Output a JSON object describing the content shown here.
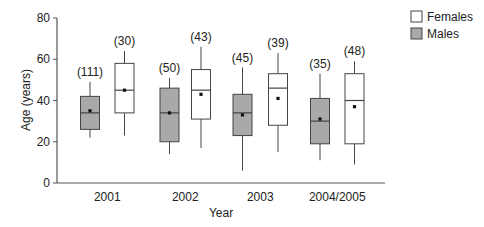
{
  "chart_data": {
    "type": "boxplot",
    "title": "",
    "xlabel": "Year",
    "ylabel": "Age (years)",
    "ylim": [
      0,
      80
    ],
    "yticks": [
      0,
      20,
      40,
      60,
      80
    ],
    "grid": false,
    "legend_position": "top-right",
    "categories": [
      "2001",
      "2002",
      "2003",
      "2004/2005"
    ],
    "series": [
      {
        "name": "Males",
        "fill": "#a9a9a9",
        "boxes": [
          {
            "category": "2001",
            "n": "(111)",
            "whisker_low": 22,
            "q1": 26,
            "median": 34,
            "q3": 42,
            "whisker_high": 49,
            "mean": 35
          },
          {
            "category": "2002",
            "n": "(50)",
            "whisker_low": 14,
            "q1": 20,
            "median": 34,
            "q3": 46,
            "whisker_high": 51,
            "mean": 34
          },
          {
            "category": "2003",
            "n": "(45)",
            "whisker_low": 6,
            "q1": 23,
            "median": 34,
            "q3": 43,
            "whisker_high": 56,
            "mean": 33
          },
          {
            "category": "2004/2005",
            "n": "(35)",
            "whisker_low": 11,
            "q1": 19,
            "median": 30,
            "q3": 41,
            "whisker_high": 53,
            "mean": 31
          }
        ]
      },
      {
        "name": "Females",
        "fill": "#ffffff",
        "boxes": [
          {
            "category": "2001",
            "n": "(30)",
            "whisker_low": 23,
            "q1": 34,
            "median": 45,
            "q3": 58,
            "whisker_high": 64,
            "mean": 45
          },
          {
            "category": "2002",
            "n": "(43)",
            "whisker_low": 17,
            "q1": 31,
            "median": 45,
            "q3": 55,
            "whisker_high": 66,
            "mean": 43
          },
          {
            "category": "2003",
            "n": "(39)",
            "whisker_low": 15,
            "q1": 28,
            "median": 46,
            "q3": 53,
            "whisker_high": 63,
            "mean": 41
          },
          {
            "category": "2004/2005",
            "n": "(48)",
            "whisker_low": 9,
            "q1": 19,
            "median": 40,
            "q3": 53,
            "whisker_high": 59,
            "mean": 37
          }
        ]
      }
    ],
    "legend": [
      {
        "label": "Females",
        "fill": "#ffffff"
      },
      {
        "label": "Males",
        "fill": "#a9a9a9"
      }
    ]
  },
  "colors": {
    "axis": "#555555",
    "box_stroke": "#444444",
    "text": "#222222"
  }
}
